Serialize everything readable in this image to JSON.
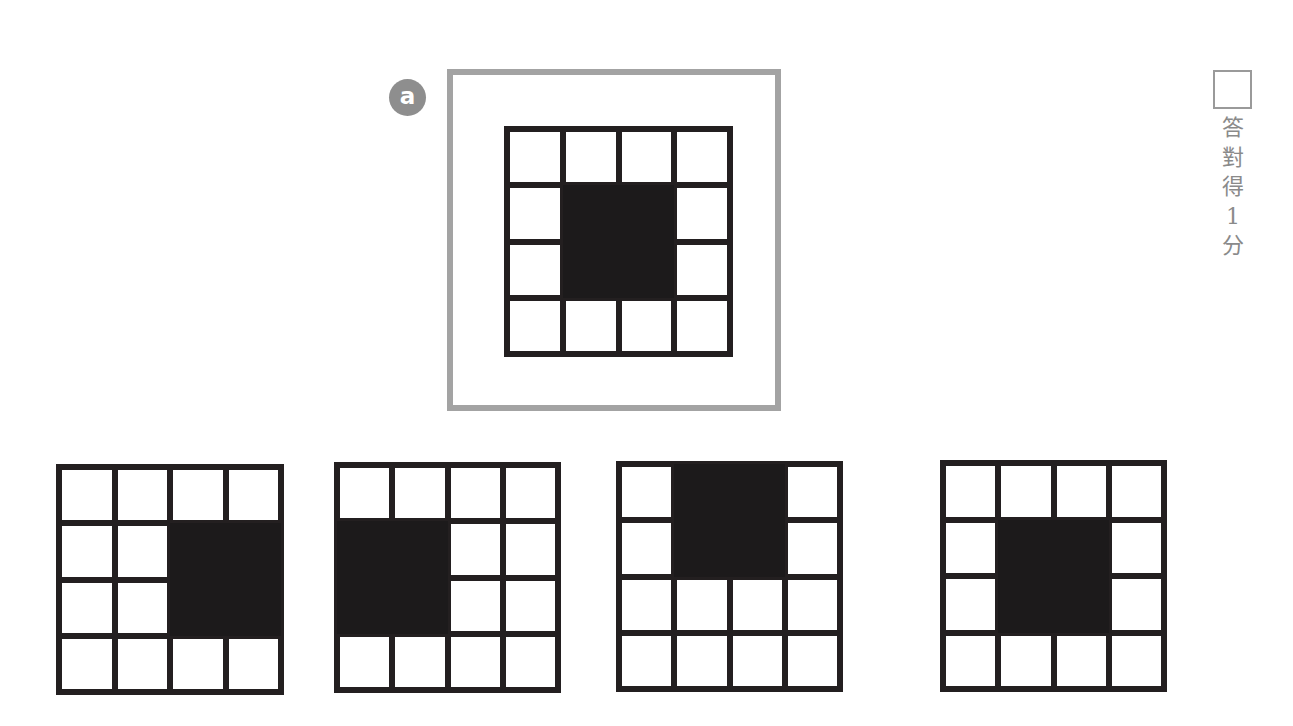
{
  "question": {
    "badge_label": "a",
    "stem": {
      "grid_size": [
        4,
        4
      ],
      "filled_cells": [
        [
          1,
          1
        ],
        [
          1,
          2
        ],
        [
          2,
          1
        ],
        [
          2,
          2
        ]
      ],
      "description": "4x4 grid with 2x2 black block in center"
    },
    "options": [
      {
        "index": 1,
        "grid_size": [
          4,
          4
        ],
        "filled_cells": [
          [
            1,
            2
          ],
          [
            1,
            3
          ],
          [
            2,
            2
          ],
          [
            2,
            3
          ]
        ],
        "description": "2x2 black block at right-middle"
      },
      {
        "index": 2,
        "grid_size": [
          4,
          4
        ],
        "filled_cells": [
          [
            1,
            0
          ],
          [
            1,
            1
          ],
          [
            2,
            0
          ],
          [
            2,
            1
          ]
        ],
        "description": "2x2 black block at left-middle"
      },
      {
        "index": 3,
        "grid_size": [
          4,
          4
        ],
        "filled_cells": [
          [
            0,
            1
          ],
          [
            0,
            2
          ],
          [
            1,
            1
          ],
          [
            1,
            2
          ]
        ],
        "description": "2x2 black block at top-center"
      },
      {
        "index": 4,
        "grid_size": [
          4,
          4
        ],
        "filled_cells": [
          [
            1,
            1
          ],
          [
            1,
            2
          ],
          [
            2,
            1
          ],
          [
            2,
            2
          ]
        ],
        "description": "2x2 black block in center"
      }
    ]
  },
  "scoring": {
    "answer_box_value": "",
    "label_chars": [
      "答",
      "對",
      "得",
      "1",
      "分"
    ]
  },
  "colors": {
    "frame_border": "#a3a3a3",
    "grid_line": "#231f20",
    "filled_cell": "#1c1a1b",
    "badge_bg": "#8e8e8e",
    "score_text": "#8a8a8a"
  }
}
